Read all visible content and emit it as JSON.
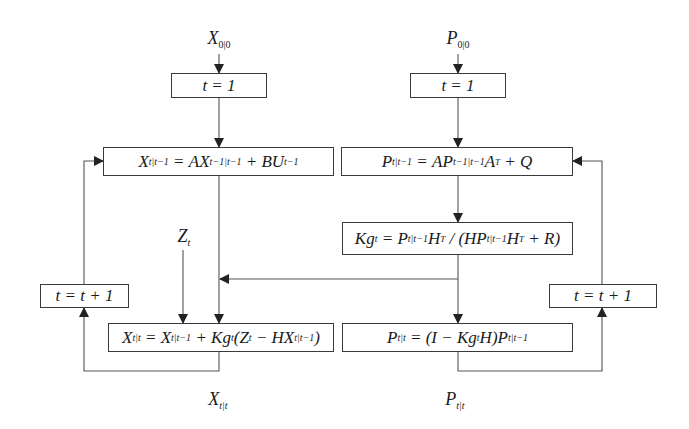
{
  "inputs": {
    "state_init": {
      "symbol": "X",
      "sub": "0|0"
    },
    "cov_init": {
      "symbol": "P",
      "sub": "0|0"
    },
    "measurement": {
      "symbol": "Z",
      "sub": "t"
    }
  },
  "outputs": {
    "state_est": {
      "symbol": "X",
      "sub": "t|t"
    },
    "cov_est": {
      "symbol": "P",
      "sub": "t|t"
    }
  },
  "boxes": {
    "init_left": {
      "text": "t = 1"
    },
    "init_right": {
      "text": "t = 1"
    },
    "increment_left": {
      "text": "t = t + 1"
    },
    "increment_right": {
      "text": "t = t + 1"
    },
    "state_predict": {
      "lhs": "X",
      "lhs_sub": "t|t−1",
      "eq": " = ",
      "a": "AX",
      "a_sub": "t−1|t−1",
      "b": " + BU",
      "b_sub": "t−1"
    },
    "cov_predict": {
      "lhs": "P",
      "lhs_sub": "t|t−1",
      "eq": " = ",
      "a": "AP",
      "a_sub": "t−1|t−1",
      "b": "A",
      "b_sup": "T",
      "c": " + Q"
    },
    "kalman_gain": {
      "lhs": "Kg",
      "lhs_sub": "t",
      "eq": " = ",
      "a": "P",
      "a_sub": "t|t−1",
      "b": "H",
      "b_sup": "T",
      "c": " / (HP",
      "c_sub": "t|t−1",
      "d": "H",
      "d_sup": "T",
      "e": " + R)"
    },
    "state_update": {
      "lhs": "X",
      "lhs_sub": "t|t",
      "eq": " = ",
      "a": "X",
      "a_sub": "t|t−1",
      "b": " + Kg",
      "b_sub": "t",
      "c": "(Z",
      "c_sub": "t",
      "d": " − HX",
      "d_sub": "t|t−1",
      "e": ")"
    },
    "cov_update": {
      "lhs": "P",
      "lhs_sub": "t|t",
      "eq": " = ",
      "a": "(I − Kg",
      "a_sub": "t",
      "b": "H)P",
      "b_sub": "t|t−1"
    }
  },
  "colors": {
    "line": "#555555",
    "arrow": "#222222",
    "box_border": "#3a3a3a"
  }
}
